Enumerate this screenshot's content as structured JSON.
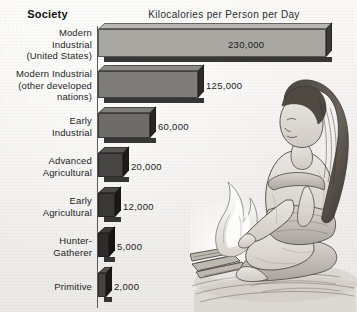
{
  "chart_data": {
    "type": "bar",
    "orientation": "horizontal",
    "title": "Kilocalories per Person per Day",
    "category_header": "Society",
    "xlabel": "",
    "ylabel": "Society",
    "grid": false,
    "legend": "none",
    "xlim": [
      0,
      230000
    ],
    "categories": [
      "Modern Industrial (United States)",
      "Modern Industrial (other developed nations)",
      "Early Industrial",
      "Advanced Agricultural",
      "Early Agricultural",
      "Hunter-Gatherer",
      "Primitive"
    ],
    "values": [
      230000,
      125000,
      60000,
      20000,
      12000,
      5000,
      2000
    ],
    "value_labels": [
      "230,000",
      "125,000",
      "60,000",
      "20,000",
      "12,000",
      "5,000",
      "2,000"
    ],
    "units": "kilocalories per person per day"
  },
  "header": {
    "category_header": "Society",
    "chart_title": "Kilocalories per Person per Day"
  },
  "rows": [
    {
      "label_lines": [
        "Modern",
        "Industrial",
        "(United States)"
      ],
      "value_label": "230,000",
      "value": 230000,
      "label_inside": true,
      "fill_top": "#b9b7b2",
      "fill_front": "#a9a7a2",
      "fill_side": "#3b3a37",
      "top": 29,
      "height": 28,
      "width": 228,
      "label_y": 27,
      "value_x": 228,
      "value_y": 39
    },
    {
      "label_lines": [
        "Modern Industrial",
        "(other developed",
        "nations)"
      ],
      "value_label": "125,000",
      "value": 125000,
      "label_inside": false,
      "fill_top": "#8d8b87",
      "fill_front": "#7e7c78",
      "fill_side": "#2e2d2b",
      "top": 71,
      "height": 27,
      "width": 100,
      "label_y": 68,
      "value_x": 206,
      "value_y": 80
    },
    {
      "label_lines": [
        "Early",
        "Industrial"
      ],
      "value_label": "60,000",
      "value": 60000,
      "label_inside": false,
      "fill_top": "#7f7d79",
      "fill_front": "#6e6c68",
      "fill_side": "#282725",
      "top": 113,
      "height": 25,
      "width": 52,
      "label_y": 115,
      "value_x": 158,
      "value_y": 121
    },
    {
      "label_lines": [
        "Advanced",
        "Agricultural"
      ],
      "value_label": "20,000",
      "value": 20000,
      "label_inside": false,
      "fill_top": "#585653",
      "fill_front": "#474543",
      "fill_side": "#1d1c1b",
      "top": 153,
      "height": 24,
      "width": 25,
      "label_y": 155,
      "value_x": 131,
      "value_y": 161
    },
    {
      "label_lines": [
        "Early",
        "Agricultural"
      ],
      "value_label": "12,000",
      "value": 12000,
      "label_inside": false,
      "fill_top": "#4a4845",
      "fill_front": "#3a3836",
      "fill_side": "#191817",
      "top": 193,
      "height": 24,
      "width": 17,
      "label_y": 195,
      "value_x": 123,
      "value_y": 201
    },
    {
      "label_lines": [
        "Hunter-",
        "Gatherer"
      ],
      "value_label": "5,000",
      "value": 5000,
      "label_inside": false,
      "fill_top": "#3e3c3a",
      "fill_front": "#2f2d2c",
      "fill_side": "#161514",
      "top": 233,
      "height": 24,
      "width": 11,
      "label_y": 235,
      "value_x": 117,
      "value_y": 241
    },
    {
      "label_lines": [
        "Primitive"
      ],
      "value_label": "2,000",
      "value": 2000,
      "label_inside": false,
      "fill_top": "#55534f",
      "fill_front": "#46443F",
      "fill_side": "#1a1918",
      "top": 273,
      "height": 24,
      "width": 8,
      "label_y": 281,
      "value_x": 114,
      "value_y": 281
    }
  ],
  "illustration": {
    "name": "woman-kneeling-at-campfire",
    "description": "pencil line drawing of a woman kneeling beside a small cooking fire"
  },
  "colors": {
    "background": "#f4f3f1",
    "axis": "#5a5a58",
    "text": "#1d1d1d"
  }
}
